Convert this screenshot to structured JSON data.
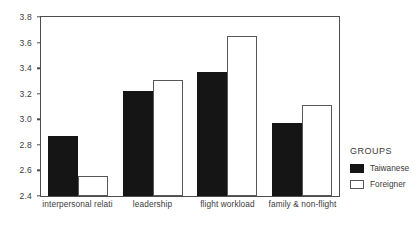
{
  "chart_data": {
    "type": "bar",
    "title": "",
    "xlabel": "",
    "ylabel": "",
    "ylim": [
      2.4,
      3.8
    ],
    "ytick_labels": [
      "3.8",
      "3.6",
      "3.4",
      "3.2",
      "3.0",
      "2.8",
      "2.6",
      "2.4"
    ],
    "ytick_values": [
      3.8,
      3.6,
      3.4,
      3.2,
      3.0,
      2.8,
      2.6,
      2.4
    ],
    "grid": false,
    "categories": [
      "interpersonal relati",
      "leadership",
      "flight workload",
      "family & non-flight"
    ],
    "series": [
      {
        "name": "Taiwanese",
        "color": "#151515",
        "values": [
          2.87,
          3.22,
          3.37,
          2.97
        ]
      },
      {
        "name": "Foreigner",
        "color": "#ffffff",
        "values": [
          2.56,
          3.31,
          3.655,
          3.11
        ]
      }
    ],
    "legend": {
      "title": "GROUPS",
      "position": "right",
      "entries": [
        {
          "label": "Taiwanese",
          "style": "filled"
        },
        {
          "label": "Foreigner",
          "style": "outline"
        }
      ]
    }
  }
}
